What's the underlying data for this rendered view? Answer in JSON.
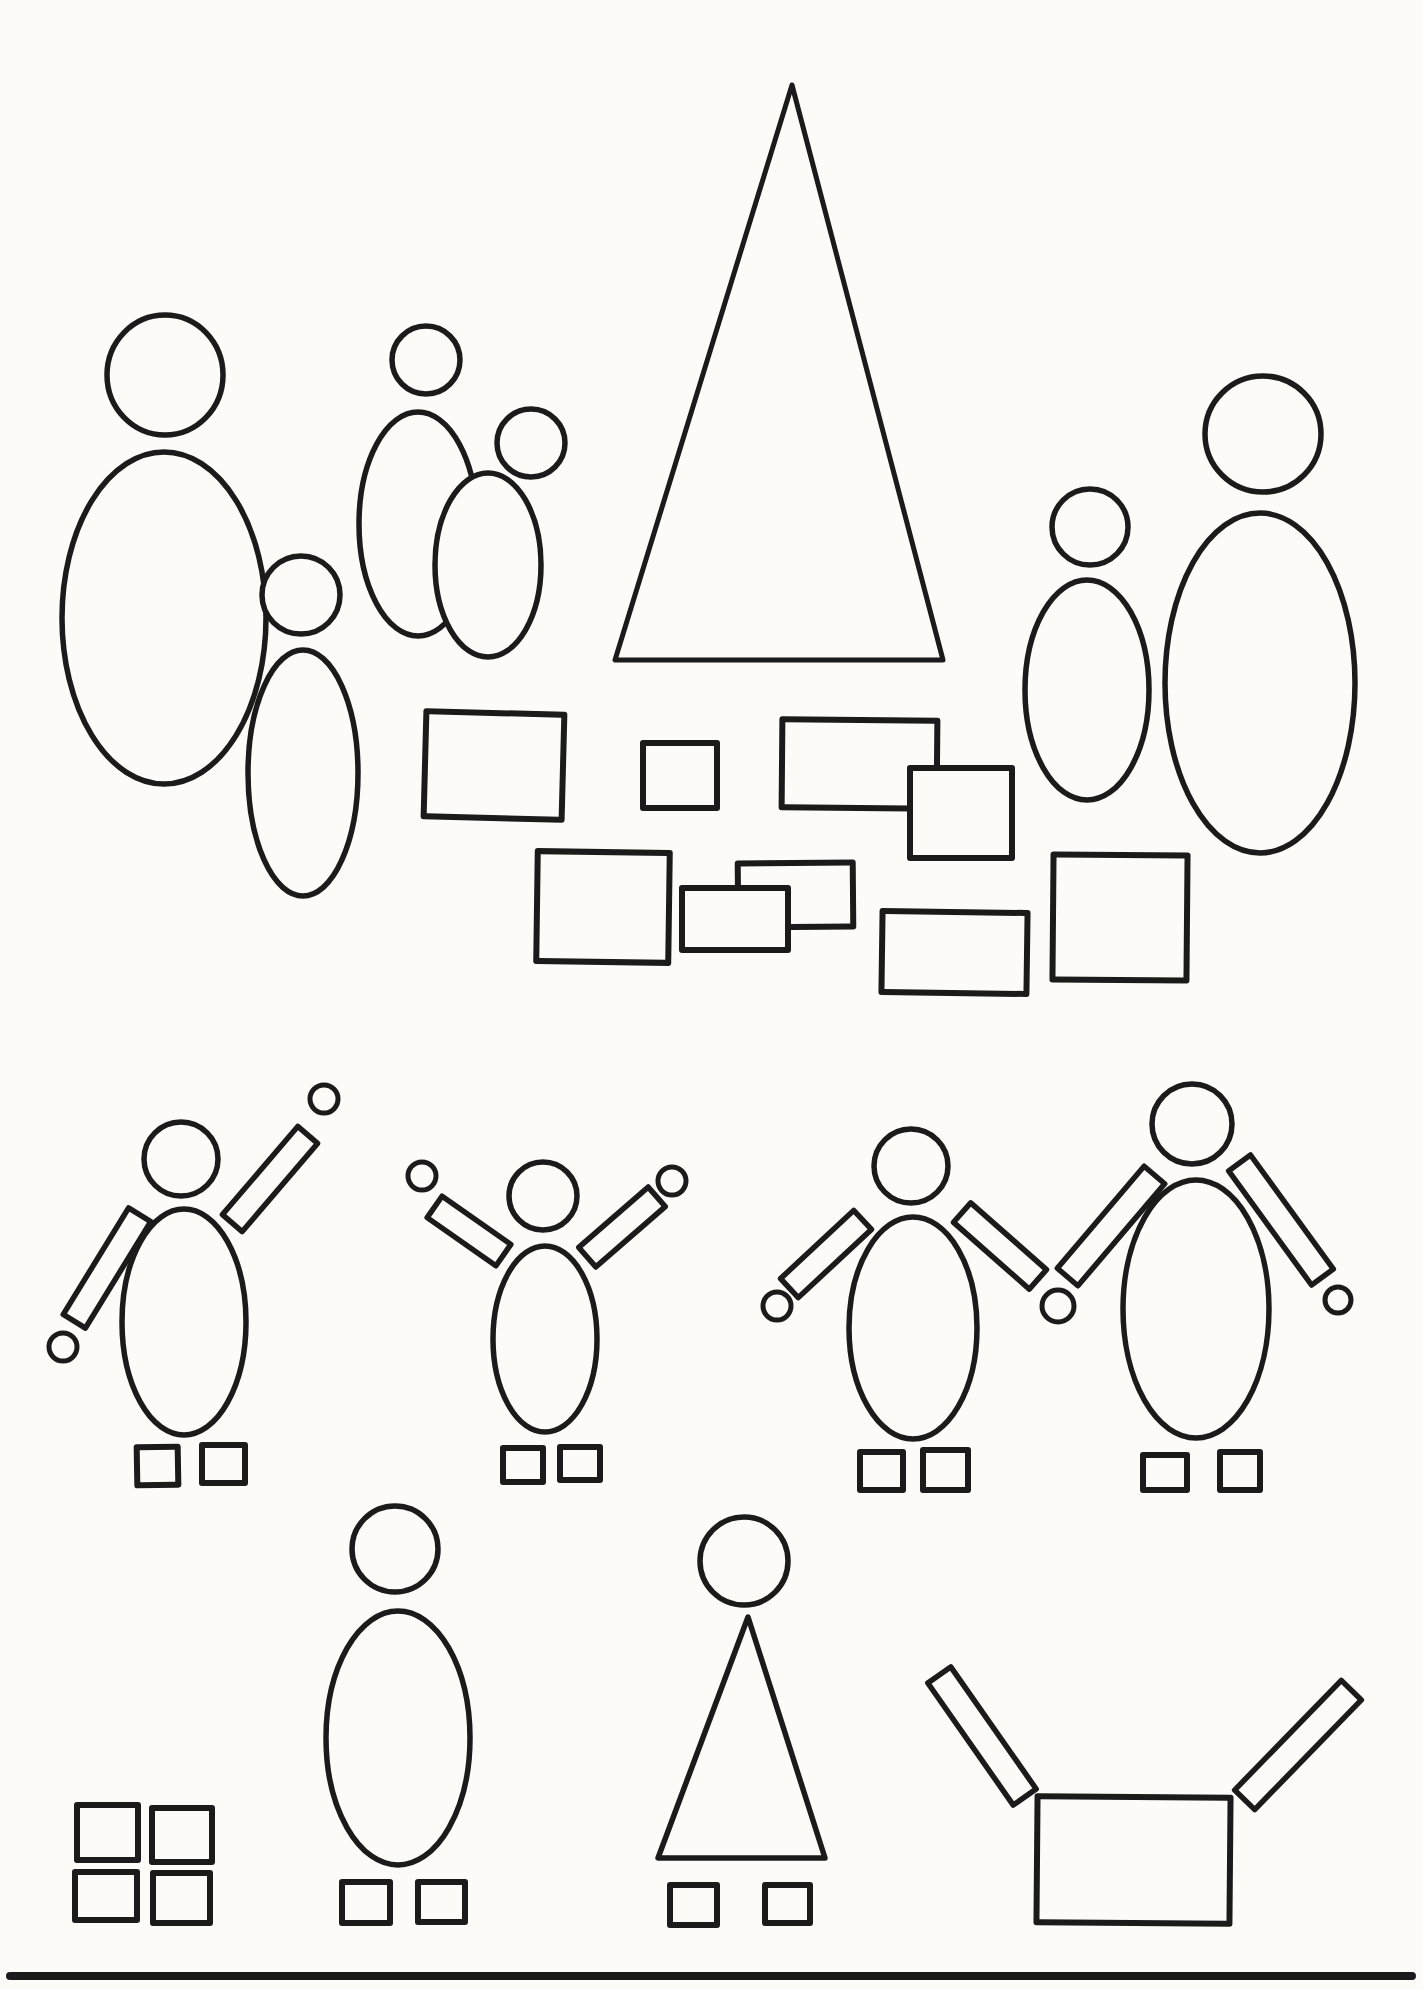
{
  "page": {
    "width": 1423,
    "height": 1989,
    "paper_color": "#fcfbf8",
    "ink_color": "#1b1b1b",
    "default_stroke_width": 5.5
  },
  "drawing": {
    "groups": [
      {
        "name": "family-parent-and-child",
        "shapes": [
          {
            "kind": "ellipse",
            "name": "parent-head-circle",
            "cx": 165,
            "cy": 375,
            "rx": 58,
            "ry": 60
          },
          {
            "kind": "ellipse",
            "name": "parent-body-oval",
            "cx": 164,
            "cy": 618,
            "rx": 102,
            "ry": 166,
            "fill": "none"
          },
          {
            "kind": "ellipse",
            "name": "child-body-oval",
            "cx": 303,
            "cy": 773,
            "rx": 55,
            "ry": 123,
            "fill": "none"
          },
          {
            "kind": "circle",
            "name": "child-head-circle",
            "cx": 301,
            "cy": 595,
            "r": 39
          }
        ]
      },
      {
        "name": "couple-overlapping-figures",
        "shapes": [
          {
            "kind": "ellipse",
            "name": "couple-body-oval-left",
            "cx": 418,
            "cy": 524,
            "rx": 59,
            "ry": 112
          },
          {
            "kind": "ellipse",
            "name": "couple-body-oval-right",
            "cx": 488,
            "cy": 565,
            "rx": 53,
            "ry": 92
          },
          {
            "kind": "circle",
            "name": "couple-head-circle-left",
            "cx": 426,
            "cy": 360,
            "r": 34
          },
          {
            "kind": "circle",
            "name": "couple-head-circle-right",
            "cx": 531,
            "cy": 443,
            "r": 34
          }
        ]
      },
      {
        "name": "large-triangle-tent",
        "shapes": [
          {
            "kind": "polygon",
            "name": "big-triangle",
            "points": "792,85 615,660 943,660",
            "sw": 5
          }
        ]
      },
      {
        "name": "scattered-building-blocks",
        "shapes": [
          {
            "kind": "rect",
            "name": "block-rect-1",
            "x": 425,
            "y": 713,
            "w": 138,
            "h": 105,
            "rot": 1.5,
            "sw": 6
          },
          {
            "kind": "rect",
            "name": "block-rect-2",
            "x": 643,
            "y": 743,
            "w": 74,
            "h": 65,
            "rot": 0,
            "sw": 6
          },
          {
            "kind": "rect",
            "name": "block-rect-3",
            "x": 782,
            "y": 720,
            "w": 155,
            "h": 88,
            "rot": 0.5,
            "sw": 6
          },
          {
            "kind": "rect",
            "name": "block-rect-4",
            "x": 910,
            "y": 768,
            "w": 102,
            "h": 90,
            "rot": 0,
            "sw": 6
          },
          {
            "kind": "rect",
            "name": "block-rect-5",
            "x": 537,
            "y": 852,
            "w": 132,
            "h": 110,
            "rot": 0.8,
            "sw": 6
          },
          {
            "kind": "rect",
            "name": "block-rect-6",
            "x": 738,
            "y": 863,
            "w": 115,
            "h": 64,
            "rot": -0.5,
            "sw": 6
          },
          {
            "kind": "rect",
            "name": "block-rect-7",
            "x": 682,
            "y": 888,
            "w": 106,
            "h": 62,
            "rot": 0,
            "sw": 6
          },
          {
            "kind": "rect",
            "name": "block-rect-8",
            "x": 882,
            "y": 912,
            "w": 145,
            "h": 81,
            "rot": 0.8,
            "sw": 6
          },
          {
            "kind": "rect",
            "name": "block-rect-9",
            "x": 1053,
            "y": 855,
            "w": 134,
            "h": 125,
            "rot": 0.5,
            "sw": 6
          }
        ]
      },
      {
        "name": "pair-of-standing-figures-right",
        "shapes": [
          {
            "kind": "ellipse",
            "name": "small-figure-body-oval",
            "cx": 1087,
            "cy": 690,
            "rx": 62,
            "ry": 110
          },
          {
            "kind": "circle",
            "name": "small-figure-head-circle",
            "cx": 1090,
            "cy": 527,
            "r": 38
          },
          {
            "kind": "ellipse",
            "name": "big-figure-body-oval",
            "cx": 1260,
            "cy": 683,
            "rx": 95,
            "ry": 170
          },
          {
            "kind": "circle",
            "name": "big-figure-head-circle",
            "cx": 1263,
            "cy": 434,
            "r": 58
          }
        ]
      },
      {
        "name": "figure-waving-one-arm-up",
        "shapes": [
          {
            "kind": "bar",
            "name": "waving-figure-raised-arm",
            "cx": 270,
            "cy": 1179,
            "len": 116,
            "w": 26,
            "angle": -49.5
          },
          {
            "kind": "bar",
            "name": "waving-figure-lowered-arm",
            "cx": 107,
            "cy": 1268,
            "len": 125,
            "w": 26,
            "angle": 121.5
          },
          {
            "kind": "ellipse",
            "name": "waving-figure-body-oval",
            "cx": 184,
            "cy": 1322,
            "rx": 62,
            "ry": 113
          },
          {
            "kind": "circle",
            "name": "waving-figure-head-circle",
            "cx": 181,
            "cy": 1159,
            "r": 37
          },
          {
            "kind": "circle",
            "name": "waving-figure-hand-up",
            "cx": 324,
            "cy": 1099,
            "r": 14,
            "sw": 5
          },
          {
            "kind": "circle",
            "name": "waving-figure-hand-down",
            "cx": 63,
            "cy": 1347,
            "r": 14,
            "sw": 5
          },
          {
            "kind": "rect",
            "name": "waving-figure-foot-left",
            "x": 137,
            "y": 1447,
            "w": 41,
            "h": 38,
            "rot": -1,
            "sw": 6
          },
          {
            "kind": "rect",
            "name": "waving-figure-foot-right",
            "x": 202,
            "y": 1445,
            "w": 43,
            "h": 38,
            "rot": 0,
            "sw": 6
          }
        ]
      },
      {
        "name": "figure-cheering-both-arms-up",
        "shapes": [
          {
            "kind": "bar",
            "name": "cheering-figure-left-arm",
            "cx": 469,
            "cy": 1231,
            "len": 84,
            "w": 26,
            "angle": 35
          },
          {
            "kind": "bar",
            "name": "cheering-figure-right-arm",
            "cx": 622,
            "cy": 1227,
            "len": 92,
            "w": 26,
            "angle": -41
          },
          {
            "kind": "ellipse",
            "name": "cheering-figure-body-oval",
            "cx": 545,
            "cy": 1339,
            "rx": 52,
            "ry": 93
          },
          {
            "kind": "circle",
            "name": "cheering-figure-head-circle",
            "cx": 543,
            "cy": 1196,
            "r": 34
          },
          {
            "kind": "circle",
            "name": "cheering-figure-left-hand",
            "cx": 422,
            "cy": 1176,
            "r": 14,
            "sw": 5
          },
          {
            "kind": "circle",
            "name": "cheering-figure-right-hand",
            "cx": 672,
            "cy": 1181,
            "r": 14,
            "sw": 5
          },
          {
            "kind": "rect",
            "name": "cheering-figure-foot-left",
            "x": 503,
            "y": 1448,
            "w": 40,
            "h": 34,
            "rot": 0,
            "sw": 6
          },
          {
            "kind": "rect",
            "name": "cheering-figure-foot-right",
            "x": 560,
            "y": 1447,
            "w": 40,
            "h": 33,
            "rot": 0,
            "sw": 6
          }
        ]
      },
      {
        "name": "two-figures-holding-hands",
        "shapes": [
          {
            "kind": "bar",
            "name": "left-partner-outer-arm",
            "cx": 826,
            "cy": 1254,
            "len": 100,
            "w": 26,
            "angle": 137
          },
          {
            "kind": "bar",
            "name": "left-partner-inner-arm",
            "cx": 1000,
            "cy": 1246,
            "len": 101,
            "w": 26,
            "angle": 41.4
          },
          {
            "kind": "bar",
            "name": "right-partner-inner-arm",
            "cx": 1111,
            "cy": 1226,
            "len": 134,
            "w": 27,
            "angle": 130.4
          },
          {
            "kind": "bar",
            "name": "right-partner-outer-arm",
            "cx": 1281,
            "cy": 1220,
            "len": 141,
            "w": 27,
            "angle": 54
          },
          {
            "kind": "ellipse",
            "name": "left-partner-body-oval",
            "cx": 913,
            "cy": 1328,
            "rx": 64,
            "ry": 111
          },
          {
            "kind": "ellipse",
            "name": "right-partner-body-oval",
            "cx": 1196,
            "cy": 1309,
            "rx": 73,
            "ry": 129
          },
          {
            "kind": "circle",
            "name": "left-partner-head-circle",
            "cx": 911,
            "cy": 1166,
            "r": 37
          },
          {
            "kind": "circle",
            "name": "right-partner-head-circle",
            "cx": 1192,
            "cy": 1124,
            "r": 40
          },
          {
            "kind": "circle",
            "name": "left-partner-free-hand",
            "cx": 777,
            "cy": 1306,
            "r": 14,
            "sw": 5
          },
          {
            "kind": "circle",
            "name": "joined-hands-circle",
            "cx": 1058,
            "cy": 1306,
            "r": 16,
            "sw": 5
          },
          {
            "kind": "circle",
            "name": "right-partner-free-hand",
            "cx": 1338,
            "cy": 1300,
            "r": 13,
            "sw": 5
          },
          {
            "kind": "rect",
            "name": "left-partner-foot-left",
            "x": 860,
            "y": 1452,
            "w": 43,
            "h": 38,
            "rot": 0,
            "sw": 6
          },
          {
            "kind": "rect",
            "name": "left-partner-foot-right",
            "x": 923,
            "y": 1450,
            "w": 45,
            "h": 40,
            "rot": 0,
            "sw": 6
          },
          {
            "kind": "rect",
            "name": "right-partner-foot-left",
            "x": 1143,
            "y": 1455,
            "w": 44,
            "h": 35,
            "rot": 0,
            "sw": 6
          },
          {
            "kind": "rect",
            "name": "right-partner-foot-right",
            "x": 1220,
            "y": 1452,
            "w": 40,
            "h": 38,
            "rot": 0,
            "sw": 6
          }
        ]
      },
      {
        "name": "grid-of-four-squares",
        "shapes": [
          {
            "kind": "rect",
            "name": "square-top-left",
            "x": 77,
            "y": 1805,
            "w": 61,
            "h": 55,
            "rot": 0,
            "sw": 6
          },
          {
            "kind": "rect",
            "name": "square-top-right",
            "x": 152,
            "y": 1808,
            "w": 60,
            "h": 54,
            "rot": 0,
            "sw": 6
          },
          {
            "kind": "rect",
            "name": "square-bottom-left",
            "x": 75,
            "y": 1872,
            "w": 62,
            "h": 48,
            "rot": 0,
            "sw": 6
          },
          {
            "kind": "rect",
            "name": "square-bottom-right",
            "x": 153,
            "y": 1873,
            "w": 57,
            "h": 50,
            "rot": 0,
            "sw": 6
          }
        ]
      },
      {
        "name": "simple-figure-oval-body",
        "shapes": [
          {
            "kind": "ellipse",
            "name": "oval-figure-body",
            "cx": 398,
            "cy": 1738,
            "rx": 72,
            "ry": 127
          },
          {
            "kind": "circle",
            "name": "oval-figure-head",
            "cx": 395,
            "cy": 1549,
            "r": 43
          },
          {
            "kind": "rect",
            "name": "oval-figure-foot-left",
            "x": 342,
            "y": 1882,
            "w": 48,
            "h": 41,
            "rot": 0,
            "sw": 6
          },
          {
            "kind": "rect",
            "name": "oval-figure-foot-right",
            "x": 418,
            "y": 1882,
            "w": 47,
            "h": 40,
            "rot": 0,
            "sw": 6
          }
        ]
      },
      {
        "name": "simple-figure-triangle-body",
        "shapes": [
          {
            "kind": "polygon",
            "name": "triangle-figure-body",
            "points": "748,1617 658,1858 825,1858",
            "sw": 5.5
          },
          {
            "kind": "circle",
            "name": "triangle-figure-head",
            "cx": 744,
            "cy": 1561,
            "r": 44
          },
          {
            "kind": "rect",
            "name": "triangle-figure-foot-left",
            "x": 670,
            "y": 1885,
            "w": 47,
            "h": 40,
            "rot": 0,
            "sw": 6
          },
          {
            "kind": "rect",
            "name": "triangle-figure-foot-right",
            "x": 765,
            "y": 1885,
            "w": 45,
            "h": 38,
            "rot": 0,
            "sw": 6
          }
        ]
      },
      {
        "name": "box-torso-with-raised-arms",
        "shapes": [
          {
            "kind": "bar",
            "name": "box-figure-left-arm",
            "cx": 982,
            "cy": 1736,
            "len": 149,
            "w": 28,
            "angle": 55
          },
          {
            "kind": "bar",
            "name": "box-figure-right-arm",
            "cx": 1298,
            "cy": 1745,
            "len": 153,
            "w": 28,
            "angle": -45.8
          },
          {
            "kind": "rect",
            "name": "box-figure-body-rect",
            "x": 1037,
            "y": 1797,
            "w": 193,
            "h": 126,
            "rot": 0.5,
            "sw": 6
          }
        ]
      },
      {
        "name": "page-bottom-rule",
        "shapes": [
          {
            "kind": "line",
            "name": "bottom-horizontal-line",
            "x1": 10,
            "y1": 1976,
            "x2": 1412,
            "y2": 1976,
            "sw": 8
          }
        ]
      }
    ]
  }
}
